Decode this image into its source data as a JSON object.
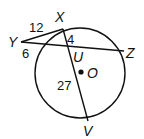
{
  "diagram": {
    "circle": {
      "center_label": "O",
      "cx": 80,
      "cy": 73,
      "r": 45
    },
    "points": {
      "X": {
        "label": "X",
        "x": 63,
        "y": 29
      },
      "Y": {
        "label": "Y",
        "x": 21,
        "y": 42
      },
      "Z": {
        "label": "Z",
        "x": 124,
        "y": 51
      },
      "U": {
        "label": "U",
        "x": 68,
        "y": 48
      },
      "V": {
        "label": "V",
        "x": 88,
        "y": 121
      },
      "O": {
        "label": "O",
        "x": 81,
        "y": 72
      }
    },
    "segment_labels": {
      "YX_outer": "12",
      "Y_secant_outer": "6",
      "XU": "4",
      "UV": "27"
    }
  }
}
